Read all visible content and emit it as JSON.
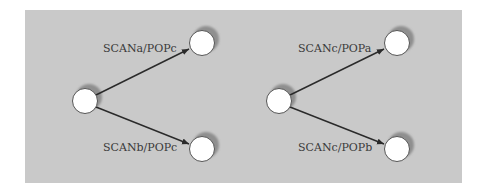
{
  "colors": {
    "panel": "#c9c9c9",
    "node_fill": "#ffffff",
    "node_stroke": "#555555",
    "shadow": "#8f8f8f",
    "edge": "#2a2a2a",
    "label": "#3a3a3a"
  },
  "diagrams": [
    {
      "name": "left",
      "edges": [
        {
          "label": "SCANa/POPc",
          "target": "top"
        },
        {
          "label": "SCANb/POPc",
          "target": "bottom"
        }
      ]
    },
    {
      "name": "right",
      "edges": [
        {
          "label": "SCANc/POPa",
          "target": "top"
        },
        {
          "label": "SCANc/POPb",
          "target": "bottom"
        }
      ]
    }
  ]
}
